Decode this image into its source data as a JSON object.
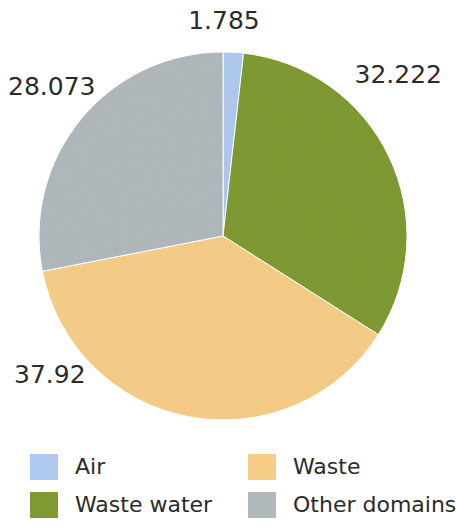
{
  "chart_data": {
    "type": "pie",
    "title": "",
    "subtitle": "",
    "xlabel": "",
    "ylabel": "",
    "grid": false,
    "legend_position": "bottom",
    "start_angle_deg": 0,
    "direction": "clockwise",
    "center": {
      "x": 223,
      "y": 236
    },
    "radius": 184,
    "categories": [
      "Air",
      "Waste water",
      "Waste",
      "Other domains"
    ],
    "values": [
      1.785,
      32.222,
      37.92,
      28.073
    ],
    "value_labels": [
      "1.785",
      "32.222",
      "37.92",
      "28.073"
    ],
    "colors": [
      "#afc8ee",
      "#7f9a33",
      "#f5cd87",
      "#b0b8bc"
    ],
    "slices": [
      {
        "name": "Air",
        "value": 1.785,
        "label": "1.785",
        "color": "#afc8ee",
        "start_deg": 0.0,
        "sweep_deg": 6.426
      },
      {
        "name": "Waste water",
        "value": 32.222,
        "label": "32.222",
        "color": "#7f9a33",
        "start_deg": 6.426,
        "sweep_deg": 115.999
      },
      {
        "name": "Waste",
        "value": 37.92,
        "label": "37.92",
        "color": "#f5cd87",
        "start_deg": 122.425,
        "sweep_deg": 136.512
      },
      {
        "name": "Other domains",
        "value": 28.073,
        "label": "28.073",
        "color": "#b0b8bc",
        "start_deg": 258.937,
        "sweep_deg": 101.063
      }
    ]
  },
  "labels": {
    "air": "1.785",
    "waste_water": "32.222",
    "waste": "37.92",
    "other_domains": "28.073"
  },
  "legend": {
    "items": [
      {
        "label": "Air",
        "color": "#afc8ee"
      },
      {
        "label": "Waste",
        "color": "#f5cd87"
      },
      {
        "label": "Waste water",
        "color": "#7f9a33"
      },
      {
        "label": "Other domains",
        "color": "#b0b8bc"
      }
    ]
  }
}
